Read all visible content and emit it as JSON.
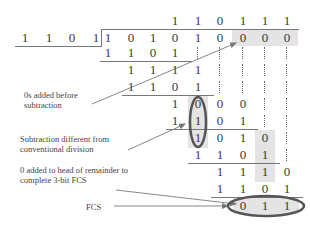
{
  "divisor": [
    "1",
    "1",
    "0",
    "1"
  ],
  "quotient": [
    "1",
    "1",
    "0",
    "1",
    "1",
    "1"
  ],
  "dividend": [
    "1",
    "0",
    "1",
    "0",
    "1",
    "0",
    "0",
    "0",
    "0"
  ],
  "rows": [
    {
      "start": 0,
      "digits": [
        "1",
        "1",
        "0",
        "1"
      ],
      "dots": [
        4,
        5,
        6,
        7,
        8
      ]
    },
    {
      "start": 1,
      "digits": [
        "1",
        "1",
        "1",
        "1"
      ],
      "dots": [
        5,
        6,
        7,
        8
      ]
    },
    {
      "start": 1,
      "digits": [
        "1",
        "1",
        "0",
        "1"
      ],
      "dots": [
        5,
        6,
        7,
        8
      ]
    },
    {
      "start": 3,
      "digits": [
        "1",
        "0",
        "0",
        "0"
      ],
      "dots": [
        7,
        8
      ]
    },
    {
      "start": 3,
      "digits": [
        "1",
        "1",
        "0",
        "1"
      ],
      "dots": [
        7,
        8
      ]
    },
    {
      "start": 4,
      "digits": [
        "1",
        "0",
        "1",
        "0"
      ],
      "dots": [
        8
      ]
    },
    {
      "start": 4,
      "digits": [
        "1",
        "1",
        "0",
        "1"
      ],
      "dots": [
        8
      ]
    },
    {
      "start": 5,
      "digits": [
        "1",
        "1",
        "1",
        "0"
      ],
      "dots": []
    },
    {
      "start": 5,
      "digits": [
        "1",
        "1",
        "0",
        "1"
      ],
      "dots": []
    },
    {
      "start": 6,
      "digits": [
        "0",
        "1",
        "1"
      ],
      "dots": []
    }
  ],
  "annotations": {
    "zeros_added": "0s added before subtraction",
    "subtraction_diff": "Subtraction different from conventional division",
    "zero_head": "0 added to head of remainder to complete 3-bit FCS",
    "fcs": "FCS"
  },
  "colors": {
    "shade": "#e4e4e4",
    "ellipse": "#555555",
    "arrow": "#777777",
    "text": "#3a3a3a"
  }
}
